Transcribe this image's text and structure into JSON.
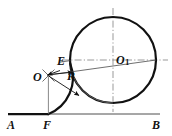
{
  "figure": {
    "background_color": "#ffffff",
    "stroke_color": "#111111",
    "thin_stroke_color": "#555555",
    "centerline_color": "#777777",
    "labels": {
      "point_a": "A",
      "point_f": "F",
      "point_b": "B",
      "point_e": "E",
      "point_o": "O",
      "radius_r": "R",
      "center_o1_base": "O",
      "center_o1_sub": "1"
    },
    "geometry": {
      "baseline": {
        "x1": 8,
        "y1": 114,
        "x2": 160,
        "y2": 114
      },
      "baseline_thick_segment": {
        "x1": 8,
        "y1": 114,
        "x2": 49,
        "y2": 114
      },
      "big_circle": {
        "cx": 113,
        "cy": 60,
        "r": 43
      },
      "arc_center_o": {
        "cx": 48,
        "cy": 75,
        "r": 39
      },
      "arc_start_point_f": {
        "x": 48,
        "y": 114
      },
      "arc_end_point_e": {
        "x": 70,
        "y": 64
      },
      "tangent_line_o_to_o1": {
        "x1": 48,
        "y1": 75,
        "x2": 156,
        "y2": 60
      },
      "vertical_drop_o_to_f": {
        "x1": 48,
        "y1": 75,
        "x2": 48,
        "y2": 114
      },
      "horizontal_center_line": {
        "x1": 62,
        "y1": 60,
        "x2": 168,
        "y2": 60
      },
      "vertical_center_line": {
        "x1": 113,
        "y1": 8,
        "x2": 113,
        "y2": 112
      }
    },
    "label_positions": {
      "point_a": {
        "x": 8,
        "y": 120
      },
      "point_f": {
        "x": 44,
        "y": 120
      },
      "point_b": {
        "x": 153,
        "y": 120
      },
      "point_e": {
        "x": 58,
        "y": 57
      },
      "point_o": {
        "x": 34,
        "y": 74
      },
      "radius_r": {
        "x": 68,
        "y": 74
      },
      "center_o1": {
        "x": 116,
        "y": 56
      }
    }
  }
}
